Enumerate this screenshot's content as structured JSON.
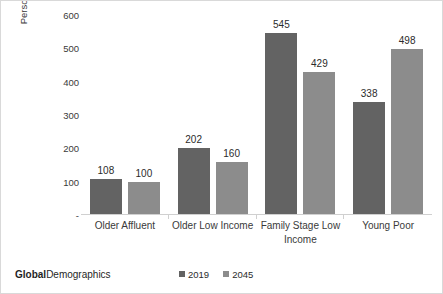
{
  "chart_data": {
    "type": "bar",
    "title": "",
    "xlabel": "",
    "ylabel": "Persons (Mns) aged 5 to 14 yrs (School Age)",
    "ylabel_lines": [
      "Persons (Mns) aged 5 to 14 yrs",
      "(School Age)"
    ],
    "categories": [
      "Older Affluent",
      "Older Low Income",
      "Family Stage Low Income",
      "Young Poor"
    ],
    "series": [
      {
        "name": "2019",
        "color": "#636363",
        "values": [
          108,
          202,
          545,
          338
        ]
      },
      {
        "name": "2045",
        "color": "#8c8c8c",
        "values": [
          100,
          160,
          429,
          498
        ]
      }
    ],
    "ylim": [
      0,
      600
    ],
    "yticks": [
      0,
      100,
      200,
      300,
      400,
      500,
      600
    ],
    "ytick_labels": [
      "-",
      "100",
      "200",
      "300",
      "400",
      "500",
      "600"
    ],
    "grid": false,
    "legend_position": "bottom-center"
  },
  "footer": {
    "brand_strong": "Global",
    "brand_light": "Demographics"
  }
}
